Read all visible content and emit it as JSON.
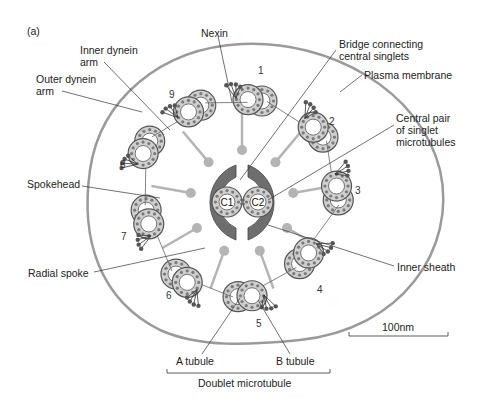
{
  "panel_label": "(a)",
  "labels": {
    "nexin": "Nexin",
    "inner_dynein_1": "Inner dynein",
    "inner_dynein_2": "arm",
    "outer_dynein_1": "Outer dynein",
    "outer_dynein_2": "arm",
    "bridge_1": "Bridge connecting",
    "bridge_2": "central singlets",
    "plasma_membrane": "Plasma membrane",
    "central_pair_1": "Central pair",
    "central_pair_2": "of singlet",
    "central_pair_3": "microtubules",
    "spokehead": "Spokehead",
    "radial_spoke": "Radial spoke",
    "inner_sheath": "Inner sheath",
    "a_tubule": "A tubule",
    "b_tubule": "B tubule",
    "doublet_microtubule": "Doublet microtubule",
    "scale_bar": "100nm",
    "c1": "C1",
    "c2": "C2"
  },
  "doublets": [
    {
      "n": "1"
    },
    {
      "n": "2"
    },
    {
      "n": "3"
    },
    {
      "n": "4"
    },
    {
      "n": "5"
    },
    {
      "n": "6"
    },
    {
      "n": "7"
    },
    {
      "n": "8"
    },
    {
      "n": "9"
    }
  ],
  "colors": {
    "membrane": "#9a9a9a",
    "tubule_fill": "#cfcfcf",
    "tubule_stroke": "#555555",
    "subunit_dot": "#7a7a7a",
    "sheath": "#6e6e6e",
    "spoke": "#b4b4b4",
    "line": "#333333"
  }
}
